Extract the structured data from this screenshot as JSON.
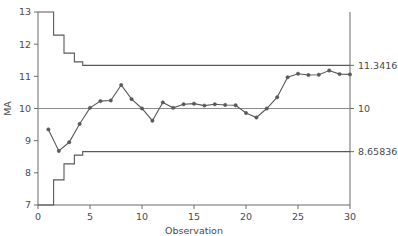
{
  "chart_data": {
    "type": "line",
    "title": "",
    "xlabel": "Observation",
    "ylabel": "MA",
    "xlim": [
      0,
      30
    ],
    "ylim": [
      7,
      13
    ],
    "xticks": [
      0,
      5,
      10,
      15,
      20,
      25,
      30
    ],
    "yticks": [
      7,
      8,
      9,
      10,
      11,
      12,
      13
    ],
    "grid": false,
    "legend": "none",
    "x": [
      1,
      2,
      3,
      4,
      5,
      6,
      7,
      8,
      9,
      10,
      11,
      12,
      13,
      14,
      15,
      16,
      17,
      18,
      19,
      20,
      21,
      22,
      23,
      24,
      25,
      26,
      27,
      28,
      29,
      30
    ],
    "series": [
      {
        "name": "MA",
        "marker": "circle",
        "color": "#595959",
        "values": [
          9.35,
          8.68,
          8.95,
          9.52,
          10.02,
          10.23,
          10.25,
          10.73,
          10.29,
          10.0,
          9.62,
          10.19,
          10.02,
          10.13,
          10.15,
          10.09,
          10.13,
          10.11,
          10.1,
          9.86,
          9.72,
          10.0,
          10.35,
          10.97,
          11.08,
          11.04,
          11.05,
          11.18,
          11.07,
          11.06
        ]
      }
    ],
    "control_limits": {
      "center_line": {
        "label": "10",
        "value": 10,
        "color": "#8c8c8c"
      },
      "upper": {
        "label": "11.3416",
        "value": 11.3416,
        "color": "#595959",
        "steps": [
          {
            "from": 0.0,
            "to": 1.5,
            "y": 13.0
          },
          {
            "from": 1.5,
            "to": 2.5,
            "y": 12.28
          },
          {
            "from": 2.5,
            "to": 3.5,
            "y": 11.72
          },
          {
            "from": 3.5,
            "to": 4.3,
            "y": 11.45
          },
          {
            "from": 4.3,
            "to": 30.0,
            "y": 11.3416
          }
        ]
      },
      "lower": {
        "label": "8.65836",
        "value": 8.65836,
        "color": "#595959",
        "steps": [
          {
            "from": 0.0,
            "to": 1.5,
            "y": 7.0
          },
          {
            "from": 1.5,
            "to": 2.5,
            "y": 7.78
          },
          {
            "from": 2.5,
            "to": 3.5,
            "y": 8.28
          },
          {
            "from": 3.5,
            "to": 4.3,
            "y": 8.55
          },
          {
            "from": 4.3,
            "to": 30.0,
            "y": 8.65836
          }
        ]
      }
    }
  }
}
